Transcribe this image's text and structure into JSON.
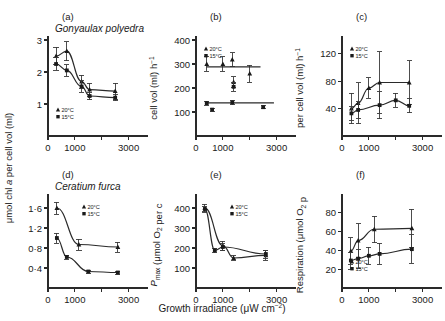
{
  "figure": {
    "xlabel": "Growth irradiance (μW cm",
    "xlabel_sup": "−2",
    "xlabel_tail": ")",
    "legend": {
      "warm": "20°C",
      "cool": "15°C"
    },
    "xticks": [
      "0",
      "1000",
      "3000"
    ]
  },
  "chart_data": [
    {
      "id": "a",
      "panel_label": "(a)",
      "type": "line",
      "title": "Gonyaulax polyedra",
      "ylabel": "μmol chl a per cell vol (ml)",
      "xlabel": "Growth irradiance (μW cm−2)",
      "xlim": [
        0,
        3200
      ],
      "ylim": [
        0,
        3
      ],
      "xticks": [
        0,
        1000,
        2000,
        3000
      ],
      "xticklabels": [
        "0",
        "1000",
        "",
        "3000"
      ],
      "yticks": [
        1,
        2,
        3
      ],
      "yticklabels": [
        "1",
        "2",
        "3"
      ],
      "grid": false,
      "legend_position": "lower-left",
      "series": [
        {
          "name": "20°C",
          "marker": "triangle",
          "x": [
            300,
            700,
            1250,
            1550,
            2500
          ],
          "values": [
            2.5,
            2.65,
            1.7,
            1.45,
            1.4
          ],
          "yerr": [
            0.28,
            0.3,
            0.2,
            0.2,
            0.25
          ]
        },
        {
          "name": "15°C",
          "marker": "square",
          "x": [
            300,
            700,
            1250,
            1550,
            2500
          ],
          "values": [
            2.25,
            2.05,
            1.55,
            1.25,
            1.2
          ],
          "yerr": [
            0.2,
            0.18,
            0.18,
            0.12,
            0.1
          ]
        }
      ]
    },
    {
      "id": "b",
      "panel_label": "(b)",
      "type": "line",
      "title": "",
      "ylabel": "cell vol (ml) h−1",
      "xlabel": "Growth irradiance (μW cm−2)",
      "xlim": [
        0,
        3200
      ],
      "ylim": [
        0,
        400
      ],
      "xticks": [
        0,
        1000,
        2000,
        3000
      ],
      "xticklabels": [
        "0",
        "1000",
        "",
        "3000"
      ],
      "yticks": [
        100,
        200,
        300,
        400
      ],
      "yticklabels": [
        "100",
        "200",
        "300",
        "400"
      ],
      "grid": false,
      "legend_position": "upper-left",
      "series": [
        {
          "name": "20°C",
          "marker": "triangle",
          "x": [
            400,
            1000,
            1350,
            1400,
            2000
          ],
          "values": [
            300,
            300,
            318,
            225,
            260
          ],
          "yerr": [
            30,
            30,
            28,
            22,
            35
          ]
        },
        {
          "name": "15°C",
          "marker": "square",
          "x": [
            400,
            600,
            1350,
            1400,
            2500
          ],
          "values": [
            137,
            110,
            140,
            205,
            120
          ],
          "yerr": [
            8,
            6,
            10,
            18,
            6
          ]
        }
      ],
      "fit_lines": [
        {
          "name": "20°C",
          "y": 288
        },
        {
          "name": "15°C",
          "y": 138
        }
      ]
    },
    {
      "id": "c",
      "panel_label": "(c)",
      "type": "line",
      "title": "",
      "ylabel": "per cell vol (ml) h−1",
      "xlabel": "Growth irradiance (μW cm−2)",
      "xlim": [
        0,
        3200
      ],
      "ylim": [
        0,
        140
      ],
      "xticks": [
        0,
        1000,
        2000,
        3000
      ],
      "xticklabels": [
        "0",
        "1000",
        "",
        "3000"
      ],
      "yticks": [
        40,
        80,
        120
      ],
      "yticklabels": [
        "40",
        "80",
        "120"
      ],
      "grid": false,
      "legend_position": "upper-left",
      "series": [
        {
          "name": "20°C",
          "marker": "triangle",
          "x": [
            350,
            600,
            1000,
            1400,
            2500
          ],
          "values": [
            40,
            48,
            70,
            78,
            78
          ],
          "yerr": [
            22,
            30,
            15,
            45,
            32
          ]
        },
        {
          "name": "15°C",
          "marker": "square",
          "x": [
            350,
            600,
            1400,
            2000,
            2500
          ],
          "values": [
            33,
            38,
            45,
            52,
            44
          ],
          "yerr": [
            10,
            12,
            20,
            10,
            10
          ]
        }
      ]
    },
    {
      "id": "d",
      "panel_label": "(d)",
      "type": "line",
      "title": "Ceratium furca",
      "ylabel": "μmol chl a per cell vol (ml)",
      "xlabel": "Growth irradiance (μW cm−2)",
      "xlim": [
        0,
        3200
      ],
      "ylim": [
        0,
        1.8
      ],
      "xticks": [
        0,
        1000,
        2000,
        3000
      ],
      "xticklabels": [
        "0",
        "1000",
        "",
        "3000"
      ],
      "yticks": [
        0.4,
        0.8,
        1.2,
        1.6
      ],
      "yticklabels": [
        "0·4",
        "0·8",
        "1·2",
        "1·6"
      ],
      "grid": false,
      "legend_position": "upper-right",
      "series": [
        {
          "name": "20°C",
          "marker": "triangle",
          "x": [
            330,
            1150,
            2600
          ],
          "values": [
            1.6,
            0.87,
            0.82
          ],
          "yerr": [
            0.12,
            0.11,
            0.1
          ]
        },
        {
          "name": "15°C",
          "marker": "square",
          "x": [
            330,
            700,
            1500,
            2600
          ],
          "values": [
            1.0,
            0.62,
            0.33,
            0.31
          ],
          "yerr": [
            0.1,
            0.04,
            0.03,
            0.03
          ]
        }
      ]
    },
    {
      "id": "e",
      "panel_label": "(e)",
      "type": "line",
      "title": "",
      "ylabel": "Pmax (μmol O2 per cell vol (ml) h−1)",
      "xlabel": "Growth irradiance (μW cm−2)",
      "xlim": [
        0,
        3200
      ],
      "ylim": [
        0,
        450
      ],
      "xticks": [
        0,
        1000,
        2000,
        3000
      ],
      "xticklabels": [
        "0",
        "1000",
        "",
        "3000"
      ],
      "yticks": [
        100,
        200,
        300,
        400
      ],
      "yticklabels": [
        "100",
        "200",
        "300",
        "400"
      ],
      "grid": false,
      "legend_position": "upper-right",
      "series": [
        {
          "name": "20°C",
          "marker": "triangle",
          "x": [
            330,
            1000,
            1400,
            2600
          ],
          "values": [
            400,
            212,
            150,
            163
          ],
          "yerr": [
            18,
            22,
            12,
            25
          ]
        },
        {
          "name": "15°C",
          "marker": "square",
          "x": [
            330,
            700,
            1000,
            2600
          ],
          "values": [
            395,
            188,
            205,
            170
          ],
          "yerr": [
            15,
            12,
            18,
            20
          ]
        }
      ]
    },
    {
      "id": "f",
      "panel_label": "(f)",
      "type": "line",
      "title": "",
      "ylabel": "Respiration (μmol O2 per cell vol (ml) h−1)",
      "xlabel": "Growth irradiance (μW cm−2)",
      "xlim": [
        0,
        3200
      ],
      "ylim": [
        0,
        95
      ],
      "xticks": [
        0,
        1000,
        2000,
        3000
      ],
      "xticklabels": [
        "0",
        "1000",
        "",
        "3000"
      ],
      "yticks": [
        20,
        40,
        60,
        80
      ],
      "yticklabels": [
        "20",
        "40",
        "60",
        "80"
      ],
      "grid": false,
      "legend_position": "lower-left",
      "series": [
        {
          "name": "20°C",
          "marker": "triangle",
          "x": [
            330,
            600,
            1200,
            2600
          ],
          "values": [
            39,
            50,
            62,
            63
          ],
          "yerr": [
            14,
            18,
            14,
            20
          ]
        },
        {
          "name": "15°C",
          "marker": "square",
          "x": [
            330,
            600,
            1000,
            1400,
            2600
          ],
          "values": [
            29,
            31,
            34,
            36,
            41
          ],
          "yerr": [
            9,
            10,
            9,
            11,
            15
          ]
        }
      ]
    }
  ]
}
